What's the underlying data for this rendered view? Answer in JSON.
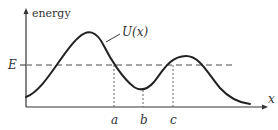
{
  "diagram": {
    "type": "potential-energy-curve",
    "y_axis_label": "energy",
    "x_axis_label": "x",
    "curve_label": "U(x)",
    "energy_level_label": "E",
    "turning_points": [
      {
        "label": "a",
        "x": 113
      },
      {
        "label": "b",
        "x": 143
      },
      {
        "label": "c",
        "x": 173
      }
    ],
    "colors": {
      "curve": "#222222",
      "axes": "#333333",
      "energy_line": "#888888",
      "guides": "#555555"
    }
  }
}
